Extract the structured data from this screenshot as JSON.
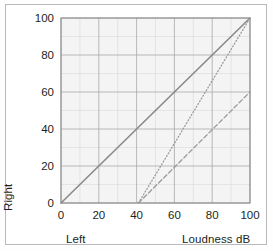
{
  "chart_data": {
    "type": "line",
    "title": "",
    "xlabel": "Loudness dB",
    "ylabel": "Loudness dB",
    "axis_corner_labels": {
      "x_origin": "Left",
      "y_origin": "Right"
    },
    "xlim": [
      0,
      100
    ],
    "ylim": [
      0,
      100
    ],
    "xticks": [
      0,
      20,
      40,
      60,
      80,
      100
    ],
    "yticks": [
      0,
      20,
      40,
      60,
      80,
      100
    ],
    "xtick_labels": [
      "0",
      "20",
      "40",
      "60",
      "80",
      "100"
    ],
    "ytick_labels": [
      "0",
      "20",
      "40",
      "60",
      "80",
      "100"
    ],
    "minor_grid_step": 10,
    "grid": true,
    "legend": "none",
    "plot_background": "#f4f4f4",
    "grid_color": "#a6a6a6",
    "minor_grid_color": "#d8d8d8",
    "series": [
      {
        "name": "normal-hearing-reference",
        "style": "solid",
        "color": "#8a8a8a",
        "points": [
          [
            0,
            0
          ],
          [
            100,
            100
          ]
        ]
      },
      {
        "name": "recruitment-steep",
        "style": "dotted",
        "color": "#9a9a9a",
        "points": [
          [
            41,
            0
          ],
          [
            100,
            100
          ]
        ]
      },
      {
        "name": "loss-shifted",
        "style": "dashed",
        "color": "#9a9a9a",
        "points": [
          [
            41,
            0
          ],
          [
            100,
            60
          ]
        ]
      }
    ]
  },
  "figure": {
    "frame_color": "#b9b9b9",
    "tick_label_color": "#231f20"
  }
}
